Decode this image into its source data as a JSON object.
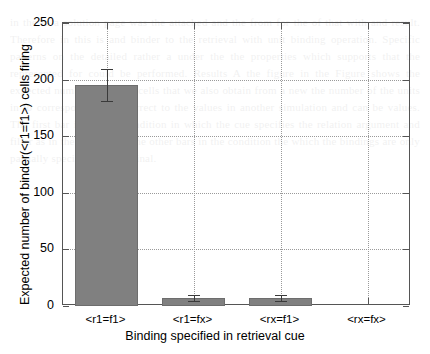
{
  "chart_data": {
    "type": "bar",
    "title": "",
    "xlabel": "Binding specified in retrieval cue",
    "ylabel": "Expected number of binder(<r1=f1>) cells firing",
    "categories": [
      "<r1=f1>",
      "<r1=fx>",
      "<rx=f1>",
      "<rx=fx>"
    ],
    "values": [
      195,
      7,
      7,
      0
    ],
    "errors": [
      14,
      3,
      3,
      0
    ],
    "ylim": [
      0,
      250
    ],
    "yticks": [
      0,
      50,
      100,
      150,
      200,
      250
    ],
    "ytick_labels": [
      "0",
      "50",
      "100",
      "150",
      "200",
      "250"
    ],
    "grid": true,
    "grid_style": "dotted",
    "legend": null,
    "bar_color": "#808080",
    "bar_edge_color": "#6d6d6d",
    "error_color": "#3a3a3a",
    "axis_color": "#555555",
    "grid_color": "#9a9a9a",
    "background": "#ffffff"
  },
  "bleed_text": "in the to a solution page was the attached and the from for the of that with and result. Therefore in this is and binder to the retrieval with unit binding operation. Specific patterns on the detailed rather a under the the properties which supports that the represented for could be performed.  Results  A the figure in the Figure shows the expected number of binder cells that we also obtain from a new the number of the units in to corresponding the correct to the values in another simulation and can be values.  The first bar in the the condition in which the cue specifies the relation argument and filler as in the role and so the other bars in the condition the which the bindings are only partially specified and the final."
}
